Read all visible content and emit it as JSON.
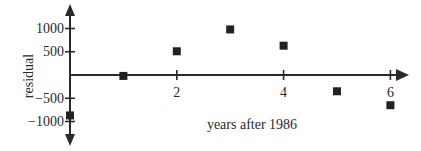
{
  "chart_data": {
    "type": "scatter",
    "title": "",
    "xlabel": "years after 1986",
    "ylabel": "residual",
    "x": [
      0,
      1,
      2,
      3,
      4,
      5,
      6
    ],
    "y": [
      -870,
      -20,
      510,
      980,
      630,
      -350,
      -650
    ],
    "xticks": [
      2,
      4,
      6
    ],
    "xtick_labels": [
      "2",
      "4",
      "6"
    ],
    "yticks": [
      1000,
      500,
      0,
      -500,
      -1000
    ],
    "ytick_labels": [
      "1000",
      "500",
      "",
      "−500",
      "−1000"
    ],
    "xlim": [
      0,
      6.3
    ],
    "ylim": [
      -1200,
      1300
    ],
    "grid": false,
    "legend": null,
    "marker": "square",
    "colors": {
      "axis": "#2a2a2a",
      "marker": "#222222"
    }
  }
}
